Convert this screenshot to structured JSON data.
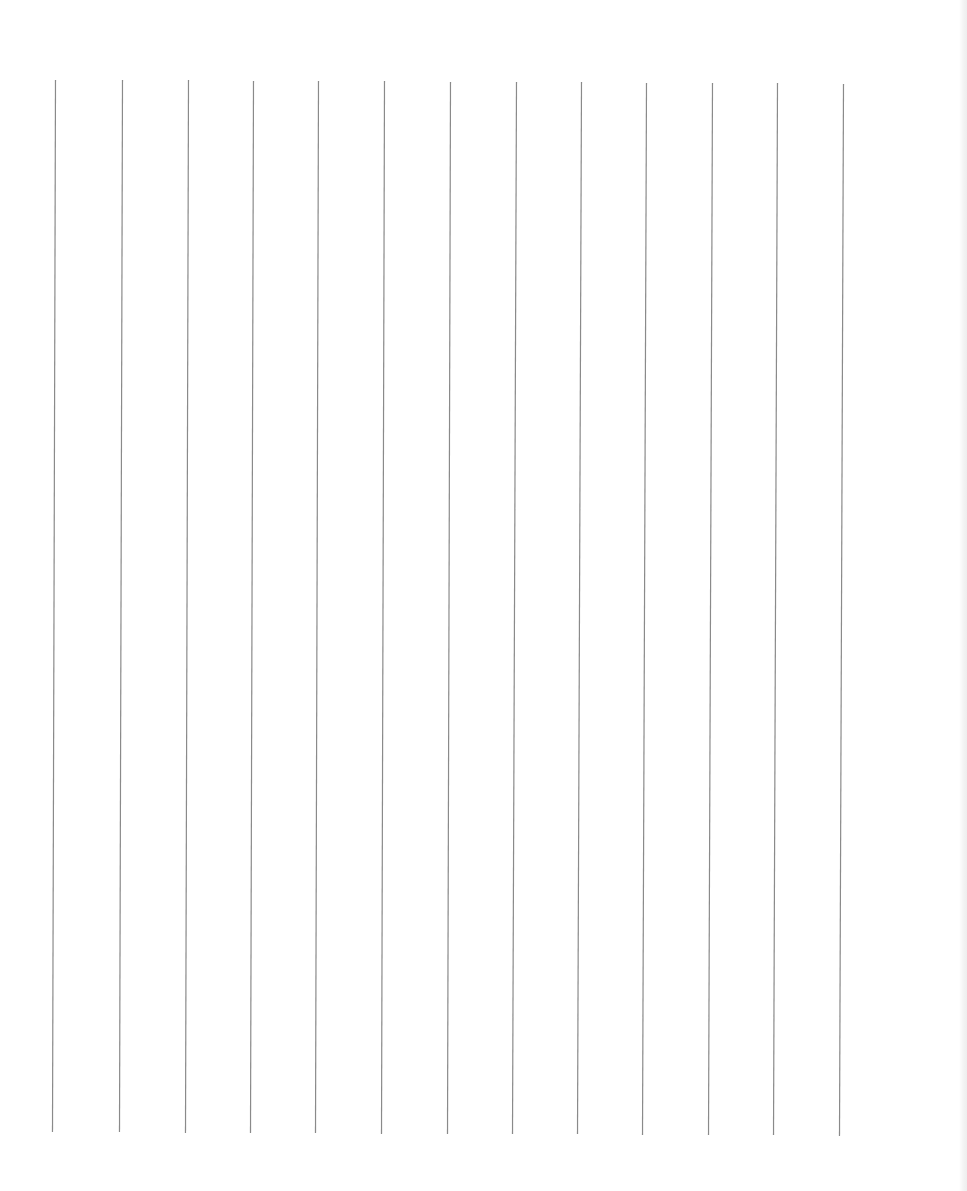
{
  "page": {
    "type": "ruled-sheet",
    "orientation": "vertical-lines",
    "background_color": "#ffffff",
    "line_color": "#8a8a8a",
    "line_width_px": 1.2,
    "line_count": 13,
    "lines": [
      {
        "x_top": 55,
        "y_top": 80,
        "x_bottom": 52,
        "y_bottom": 1132
      },
      {
        "x_top": 122,
        "y_top": 80,
        "x_bottom": 119,
        "y_bottom": 1132
      },
      {
        "x_top": 188,
        "y_top": 80,
        "x_bottom": 185,
        "y_bottom": 1133
      },
      {
        "x_top": 253,
        "y_top": 81,
        "x_bottom": 250,
        "y_bottom": 1133
      },
      {
        "x_top": 318,
        "y_top": 81,
        "x_bottom": 315,
        "y_bottom": 1133
      },
      {
        "x_top": 384,
        "y_top": 81,
        "x_bottom": 381,
        "y_bottom": 1134
      },
      {
        "x_top": 450,
        "y_top": 82,
        "x_bottom": 447,
        "y_bottom": 1134
      },
      {
        "x_top": 516,
        "y_top": 82,
        "x_bottom": 512,
        "y_bottom": 1134
      },
      {
        "x_top": 581,
        "y_top": 82,
        "x_bottom": 577,
        "y_bottom": 1134
      },
      {
        "x_top": 646,
        "y_top": 83,
        "x_bottom": 642,
        "y_bottom": 1135
      },
      {
        "x_top": 712,
        "y_top": 83,
        "x_bottom": 708,
        "y_bottom": 1135
      },
      {
        "x_top": 777,
        "y_top": 83,
        "x_bottom": 773,
        "y_bottom": 1135
      },
      {
        "x_top": 843,
        "y_top": 84,
        "x_bottom": 839,
        "y_bottom": 1136
      }
    ],
    "right_edge_shade": true
  }
}
